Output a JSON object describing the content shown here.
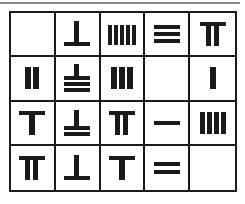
{
  "puzzle": {
    "title": "",
    "rows": 4,
    "cols": 5,
    "line_color": "#1a1a1a",
    "cells": [
      [
        {
          "glyph": "empty",
          "value": null
        },
        {
          "glyph": "rod-6-vertical-over-horizontal",
          "value": 6
        },
        {
          "glyph": "rod-5-five-verticals",
          "value": 5
        },
        {
          "glyph": "rod-3-three-horizontals",
          "value": 3
        },
        {
          "glyph": "rod-7-horizontal-over-two-verticals",
          "value": 7
        }
      ],
      [
        {
          "glyph": "rod-2-two-verticals",
          "value": 2
        },
        {
          "glyph": "rod-8-vertical-over-three-horizontals",
          "value": 8
        },
        {
          "glyph": "rod-3-three-verticals",
          "value": 3
        },
        {
          "glyph": "empty",
          "value": null
        },
        {
          "glyph": "rod-1-one-vertical",
          "value": 1
        }
      ],
      [
        {
          "glyph": "rod-6-horizontal-over-vertical",
          "value": 6
        },
        {
          "glyph": "rod-7-vertical-over-two-horizontals",
          "value": 7
        },
        {
          "glyph": "rod-7-horizontal-over-two-verticals",
          "value": 7
        },
        {
          "glyph": "rod-1-one-horizontal",
          "value": 1
        },
        {
          "glyph": "rod-4-four-verticals",
          "value": 4
        }
      ],
      [
        {
          "glyph": "rod-7-horizontal-over-two-verticals",
          "value": 7
        },
        {
          "glyph": "rod-6-vertical-over-horizontal",
          "value": 6
        },
        {
          "glyph": "rod-6-horizontal-over-vertical",
          "value": 6
        },
        {
          "glyph": "rod-2-two-horizontals",
          "value": 2
        },
        {
          "glyph": "empty",
          "value": null
        }
      ]
    ]
  }
}
